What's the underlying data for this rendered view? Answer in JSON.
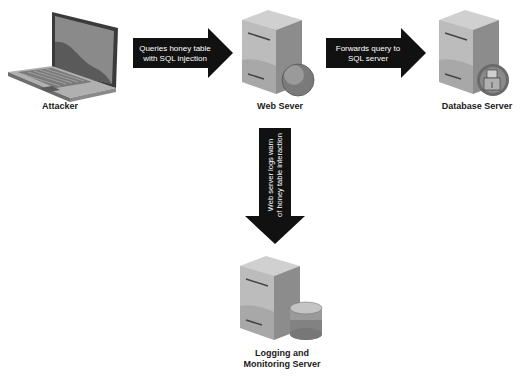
{
  "diagram": {
    "nodes": [
      {
        "id": "attacker",
        "label": "Attacker",
        "icon": "laptop-icon"
      },
      {
        "id": "web_server",
        "label": "Web Sever",
        "icon": "web-server-icon"
      },
      {
        "id": "database_server",
        "label": "Database Server",
        "icon": "database-server-icon"
      },
      {
        "id": "logging_server",
        "label_line1": "Logging and",
        "label_line2": "Monitoring Server",
        "icon": "logging-server-icon"
      }
    ],
    "edges": [
      {
        "from": "attacker",
        "to": "web_server",
        "line1": "Queries honey table",
        "line2": "with SQL injection"
      },
      {
        "from": "web_server",
        "to": "database_server",
        "line1": "Forwards query to",
        "line2": "SQL server"
      },
      {
        "from": "web_server",
        "to": "logging_server",
        "line1": "Web server logs warn",
        "line2": "of honey table interaction"
      }
    ]
  },
  "colors": {
    "arrow": "#111111",
    "server_light": "#bdbdbd",
    "server_dark": "#7a7a7a",
    "background": "#ffffff"
  }
}
